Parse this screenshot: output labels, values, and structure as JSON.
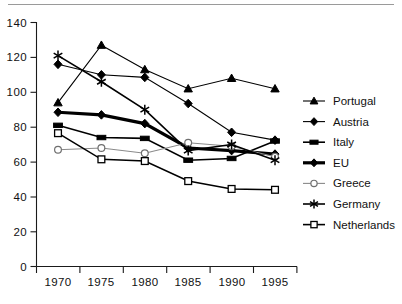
{
  "chart_data": {
    "type": "line",
    "title": "",
    "subtitle": "",
    "xlabel": "",
    "ylabel": "",
    "x": [
      1970,
      1975,
      1980,
      1985,
      1990,
      1995
    ],
    "categories": [
      "1970",
      "1975",
      "1980",
      "1985",
      "1990",
      "1995"
    ],
    "xlim": [
      1967.5,
      1997.5
    ],
    "ylim": [
      0,
      140
    ],
    "yticks": [
      0,
      20,
      40,
      60,
      80,
      100,
      120,
      140
    ],
    "ytick_labels": [
      "0",
      "20",
      "40",
      "60",
      "80",
      "100",
      "120",
      "140"
    ],
    "xtick_labels": [
      "1970",
      "1975",
      "1980",
      "1985",
      "1990",
      "1995"
    ],
    "grid": false,
    "legend_position": "right",
    "series": [
      {
        "name": "Portugal",
        "marker": "filled-triangle",
        "line_style": "solid-thin",
        "color": "#000000",
        "values": [
          94,
          127,
          113,
          102,
          108,
          102
        ]
      },
      {
        "name": "Austria",
        "marker": "filled-diamond",
        "line_style": "solid-thin",
        "color": "#000000",
        "values": [
          116,
          110,
          108.5,
          93.5,
          77,
          72.5
        ]
      },
      {
        "name": "Italy",
        "marker": "filled-rect",
        "line_style": "solid-mid",
        "color": "#000000",
        "values": [
          81,
          74,
          73.5,
          61,
          62,
          72
        ]
      },
      {
        "name": "EU",
        "marker": "filled-diamond",
        "line_style": "solid-bold",
        "color": "#000000",
        "values": [
          88.5,
          87,
          82,
          68,
          66.5,
          64.5
        ]
      },
      {
        "name": "Greece",
        "marker": "open-circle",
        "line_style": "solid-grey",
        "color": "#8a8a8a",
        "values": [
          67,
          68,
          65,
          71,
          69,
          63
        ]
      },
      {
        "name": "Germany",
        "marker": "star",
        "line_style": "solid-mid",
        "color": "#000000",
        "values": [
          121,
          106,
          90,
          66.5,
          70,
          61
        ]
      },
      {
        "name": "Netherlands",
        "marker": "open-square",
        "line_style": "solid-mid",
        "color": "#000000",
        "values": [
          76.5,
          61.5,
          60.5,
          49,
          44.5,
          44
        ]
      }
    ]
  },
  "legend": {
    "items": [
      {
        "label": "Portugal"
      },
      {
        "label": "Austria"
      },
      {
        "label": "Italy"
      },
      {
        "label": "EU"
      },
      {
        "label": "Greece"
      },
      {
        "label": "Germany"
      },
      {
        "label": "Netherlands"
      }
    ]
  }
}
